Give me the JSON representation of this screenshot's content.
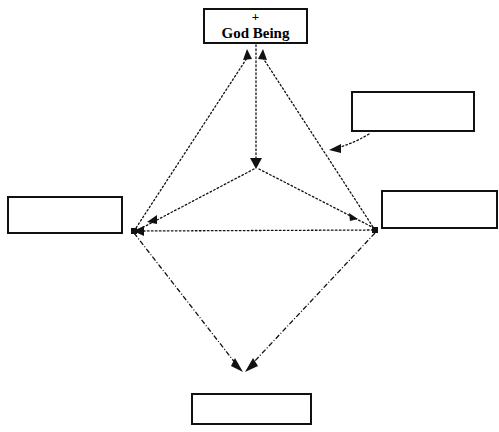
{
  "diagram": {
    "canvas": {
      "width": 499,
      "height": 432,
      "background": "#ffffff"
    },
    "stroke_color": "#111111",
    "nodes": [
      {
        "id": "god-being",
        "plus": "+",
        "label": "God Being",
        "x": 203,
        "y": 8,
        "w": 105,
        "h": 36,
        "empty": false
      },
      {
        "id": "upper-right",
        "plus": "",
        "label": "",
        "x": 351,
        "y": 91,
        "w": 124,
        "h": 41,
        "empty": true
      },
      {
        "id": "left",
        "plus": "",
        "label": "",
        "x": 7,
        "y": 196,
        "w": 116,
        "h": 38,
        "empty": true
      },
      {
        "id": "right",
        "plus": "",
        "label": "",
        "x": 381,
        "y": 190,
        "w": 117,
        "h": 39,
        "empty": true
      },
      {
        "id": "bottom",
        "plus": "",
        "label": "",
        "x": 191,
        "y": 393,
        "w": 121,
        "h": 32,
        "empty": true
      }
    ],
    "vertices": {
      "center_point": {
        "x": 256,
        "y": 166
      },
      "left_vertex": {
        "x": 134,
        "y": 231
      },
      "right_vertex": {
        "x": 375,
        "y": 230
      },
      "bottom_junction": {
        "x": 243,
        "y": 370
      }
    },
    "edges": [
      {
        "id": "left-to-god",
        "style": "dotted",
        "arrow": "end-up"
      },
      {
        "id": "right-to-god",
        "style": "dotted",
        "arrow": "end-up"
      },
      {
        "id": "god-to-center",
        "style": "dotted",
        "arrow": "end-down"
      },
      {
        "id": "center-to-left",
        "style": "dotted",
        "arrow": "mid-left"
      },
      {
        "id": "center-to-right",
        "style": "dotted",
        "arrow": "mid-up-left"
      },
      {
        "id": "right-to-left-horizontal",
        "style": "dotted",
        "arrow": "end-left"
      },
      {
        "id": "left-to-bottom",
        "style": "dash-dot",
        "arrow": "end-down-right"
      },
      {
        "id": "right-to-bottom",
        "style": "dash-dot",
        "arrow": "end-down-left"
      },
      {
        "id": "upperright-curve-to-edge",
        "style": "dotted-curve",
        "arrow": "end-left"
      }
    ]
  }
}
